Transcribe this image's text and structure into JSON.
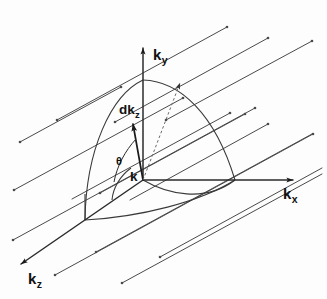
{
  "figure": {
    "kind": "k-space-hemisphere-diagram",
    "background_color": "#fdfdfd",
    "stroke_color": "#2b2b2b",
    "axes": {
      "ky": {
        "label_main": "k",
        "label_sub": "y",
        "name": "ky-axis"
      },
      "kx": {
        "label_main": "k",
        "label_sub": "x",
        "name": "kx-axis"
      },
      "kz": {
        "label_main": "k",
        "label_sub": "z",
        "name": "kz-axis"
      }
    },
    "vectors": {
      "dkz": {
        "label_main": "dk",
        "label_sub": "z"
      },
      "k": {
        "label_main": "k"
      }
    },
    "angle": {
      "symbol": "θ"
    },
    "geometry": {
      "origin": {
        "x": 143,
        "y": 180
      },
      "ky_tip": {
        "x": 143,
        "y": 45
      },
      "kx_tip": {
        "x": 296,
        "y": 180
      },
      "kz_tip": {
        "x": 18,
        "y": 266
      },
      "sphere_top": {
        "x": 143,
        "y": 80
      },
      "sphere_right": {
        "x": 235,
        "y": 180
      },
      "sphere_back": {
        "x": 85,
        "y": 220
      },
      "dkz_tip": {
        "x": 131,
        "y": 121
      },
      "dashed_tip": {
        "x": 183,
        "y": 81
      }
    },
    "grid_lines": [
      {
        "x1": 20,
        "y1": 142,
        "x2": 121,
        "y2": 87
      },
      {
        "x1": 14,
        "y1": 190,
        "x2": 183,
        "y2": 98
      },
      {
        "x1": 13,
        "y1": 240,
        "x2": 255,
        "y2": 108
      },
      {
        "x1": 55,
        "y1": 275,
        "x2": 313,
        "y2": 134
      },
      {
        "x1": 122,
        "y1": 283,
        "x2": 322,
        "y2": 174
      },
      {
        "x1": 72,
        "y1": 199,
        "x2": 230,
        "y2": 113
      },
      {
        "x1": 96,
        "y1": 252,
        "x2": 312,
        "y2": 134
      },
      {
        "x1": 160,
        "y1": 257,
        "x2": 322,
        "y2": 168
      },
      {
        "x1": 100,
        "y1": 193,
        "x2": 245,
        "y2": 114
      },
      {
        "x1": 130,
        "y1": 200,
        "x2": 268,
        "y2": 124
      },
      {
        "x1": 57,
        "y1": 120,
        "x2": 227,
        "y2": 27
      },
      {
        "x1": 115,
        "y1": 122,
        "x2": 268,
        "y2": 38
      },
      {
        "x1": 166,
        "y1": 120,
        "x2": 312,
        "y2": 41
      }
    ]
  }
}
